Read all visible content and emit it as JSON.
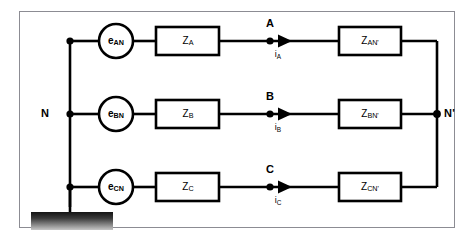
{
  "diagram": {
    "background_color": "#ffffff",
    "frame_color": "#8c8c93",
    "line_color": "#000000",
    "ground": {
      "name": "ground-bar",
      "fill_top": "#1a1a1a",
      "fill_bottom": "#bfbfbf"
    },
    "neutral": {
      "left_label": "N",
      "right_label": "N'"
    },
    "phases": [
      {
        "key": "a",
        "source_label": "e",
        "source_sub": "AN",
        "series_label": "Z",
        "series_sub": "A",
        "node_label": "A",
        "current_label": "i",
        "current_sub": "A",
        "load_label": "Z",
        "load_sub": "AN'"
      },
      {
        "key": "b",
        "source_label": "e",
        "source_sub": "BN",
        "series_label": "Z",
        "series_sub": "B",
        "node_label": "B",
        "current_label": "i",
        "current_sub": "B",
        "load_label": "Z",
        "load_sub": "BN'"
      },
      {
        "key": "c",
        "source_label": "e",
        "source_sub": "CN",
        "series_label": "Z",
        "series_sub": "C",
        "node_label": "C",
        "current_label": "i",
        "current_sub": "C",
        "load_label": "Z",
        "load_sub": "CN'"
      }
    ]
  }
}
